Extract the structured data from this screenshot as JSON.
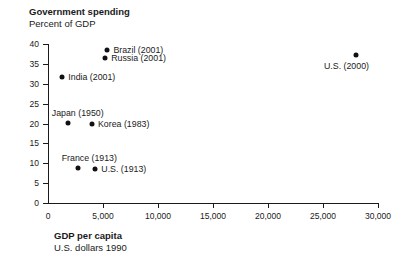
{
  "chart_data": {
    "type": "scatter",
    "title": "Government spending",
    "subtitle": "Percent of GDP",
    "xlabel": "GDP per capita",
    "xsublabel": "U.S. dollars 1990",
    "ylabel": "Percent of GDP",
    "xlim": [
      0,
      30000
    ],
    "ylim": [
      0,
      40
    ],
    "grid": false,
    "legend": "none (direct point labels)",
    "xticks": [
      0,
      5000,
      10000,
      15000,
      20000,
      25000,
      30000
    ],
    "xtick_labels": [
      "0",
      "5,000",
      "10,000",
      "15,000",
      "20,000",
      "25,000",
      "30,000"
    ],
    "yticks": [
      0,
      5,
      10,
      15,
      20,
      25,
      30,
      35,
      40
    ],
    "ytick_labels": [
      "0",
      "5",
      "10",
      "15",
      "20",
      "25",
      "30",
      "35",
      "40"
    ],
    "points": [
      {
        "label": "Brazil (2001)",
        "x": 5400,
        "y": 38.6,
        "label_pos": "right"
      },
      {
        "label": "Russia (2001)",
        "x": 5200,
        "y": 36.6,
        "label_pos": "right"
      },
      {
        "label": "India (2001)",
        "x": 1300,
        "y": 31.6,
        "label_pos": "right"
      },
      {
        "label": "U.S. (2000)",
        "x": 28000,
        "y": 37.2,
        "label_pos": "below"
      },
      {
        "label": "Japan (1950)",
        "x": 1800,
        "y": 20.2,
        "label_pos": "above"
      },
      {
        "label": "Korea (1983)",
        "x": 4000,
        "y": 20.0,
        "label_pos": "right"
      },
      {
        "label": "France (1913)",
        "x": 2700,
        "y": 8.9,
        "label_pos": "above"
      },
      {
        "label": "U.S. (1913)",
        "x": 4300,
        "y": 8.6,
        "label_pos": "right"
      }
    ]
  },
  "colors": {
    "marker": "#111111",
    "axis": "#1a1a1a",
    "background": "#ffffff"
  }
}
